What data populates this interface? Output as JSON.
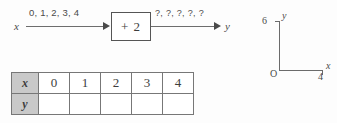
{
  "function_machine": {
    "input_variable": "x",
    "input_values_label": "0, 1, 2, 3, 4",
    "operation_label": "+ 2",
    "output_values_label": "?, ?, ?, ?, ?",
    "output_variable": "y"
  },
  "axes": {
    "y_axis_label": "y",
    "x_axis_label": "x",
    "origin_label": "O",
    "y_max_tick_label": "6",
    "x_max_tick_label": "4"
  },
  "chart_data": {
    "type": "table",
    "title": "",
    "xlabel": "x",
    "ylabel": "y",
    "categories": [
      "0",
      "1",
      "2",
      "3",
      "4"
    ],
    "series": [
      {
        "name": "x",
        "values": [
          "0",
          "1",
          "2",
          "3",
          "4"
        ]
      },
      {
        "name": "y",
        "values": [
          "",
          "",
          "",
          "",
          ""
        ]
      }
    ],
    "axis_hint": {
      "xlim": [
        0,
        4
      ],
      "ylim": [
        0,
        6
      ],
      "grid": false,
      "legend": "none"
    }
  },
  "table": {
    "rows": [
      {
        "header": "x",
        "cells": [
          "0",
          "1",
          "2",
          "3",
          "4"
        ]
      },
      {
        "header": "y",
        "cells": [
          "",
          "",
          "",
          "",
          ""
        ]
      }
    ]
  }
}
